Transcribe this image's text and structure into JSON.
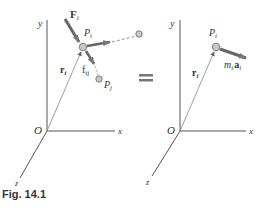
{
  "figure": {
    "caption": "Fig. 14.1",
    "equals_sign": "=",
    "left_panel": {
      "axes": {
        "y": "y",
        "x": "x",
        "z": "z",
        "origin": "O"
      },
      "position_vector": "r",
      "position_vector_sub": "i",
      "particle_i": {
        "label": "P",
        "sub": "i"
      },
      "particle_j": {
        "label": "P",
        "sub": "j"
      },
      "external_force": {
        "label": "F",
        "sub": "i"
      },
      "internal_force": {
        "label": "f",
        "sub": "ij"
      }
    },
    "right_panel": {
      "axes": {
        "y": "y",
        "x": "x",
        "z": "z",
        "origin": "O"
      },
      "position_vector": "r",
      "position_vector_sub": "i",
      "particle_i": {
        "label": "P",
        "sub": "i"
      },
      "effective_force": {
        "label": "m",
        "sub1": "i",
        "label2": "a",
        "sub2": "i"
      }
    },
    "colors": {
      "axis": "#555555",
      "vector": "#666666",
      "particle_fill": "#c8c8c8",
      "text": "#333333"
    }
  }
}
